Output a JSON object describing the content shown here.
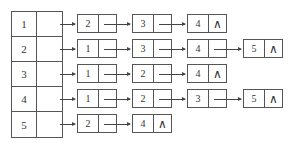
{
  "diagram": {
    "type": "adjacency-list",
    "null_symbol": "∧",
    "heads": [
      {
        "vertex": "1",
        "neighbors": [
          "2",
          "3",
          "4"
        ]
      },
      {
        "vertex": "2",
        "neighbors": [
          "1",
          "3",
          "4",
          "5"
        ]
      },
      {
        "vertex": "3",
        "neighbors": [
          "1",
          "2",
          "4"
        ]
      },
      {
        "vertex": "4",
        "neighbors": [
          "1",
          "2",
          "3",
          "5"
        ]
      },
      {
        "vertex": "5",
        "neighbors": [
          "2",
          "4"
        ]
      }
    ]
  }
}
